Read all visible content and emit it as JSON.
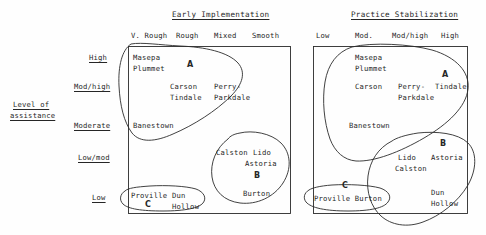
{
  "axis": {
    "y_label_line1": "Level of",
    "y_label_line2": "assistance",
    "row_labels": [
      "High",
      "Mod/high",
      "Moderate",
      "Low/mod",
      "Low"
    ]
  },
  "panels": [
    {
      "title": "Early Implementation",
      "columns": [
        "V. Rough",
        "Rough",
        "Mixed",
        "Smooth"
      ],
      "clusters": [
        {
          "letter": "A",
          "members": [
            "Masepa",
            "Plummet",
            "Carson",
            "Perry-",
            "Tindale",
            "Parkdale",
            "Banestown"
          ]
        },
        {
          "letter": "B",
          "members": [
            "Calston",
            "Lido",
            "Astoria",
            "Burton"
          ]
        },
        {
          "letter": "C",
          "members": [
            "Proville",
            "Dun",
            "Hollow"
          ]
        }
      ],
      "labels": {
        "masepa": "Masepa",
        "plummet": "Plummet",
        "a_letter": "A",
        "carson": "Carson",
        "perry": "Perry-",
        "tindale": "Tindale",
        "parkdale": "Parkdale",
        "banestown": "Banestown",
        "calston": "Calston",
        "lido": "Lido",
        "astoria": "Astoria",
        "b_letter": "B",
        "burton": "Burton",
        "proville": "Proville",
        "dun": "Dun",
        "hollow": "Hollow",
        "c_letter": "C"
      }
    },
    {
      "title": "Practice Stabilization",
      "columns": [
        "Low",
        "Mod.",
        "Mod/high",
        "High"
      ],
      "clusters": [
        {
          "letter": "A",
          "members": [
            "Masepa",
            "Plummet",
            "Carson",
            "Perry-",
            "Tindale",
            "Parkdale",
            "Banestown"
          ]
        },
        {
          "letter": "B",
          "members": [
            "Lido",
            "Astoria",
            "Calston",
            "Dun",
            "Hollow"
          ]
        },
        {
          "letter": "C",
          "members": [
            "Proville",
            "Burton"
          ]
        }
      ],
      "labels": {
        "masepa": "Masepa",
        "plummet": "Plummet",
        "a_letter": "A",
        "carson": "Carson",
        "perry": "Perry-",
        "tindale": "Tindale",
        "parkdale": "Parkdale",
        "banestown": "Banestown",
        "b_letter": "B",
        "lido": "Lido",
        "astoria": "Astoria",
        "calston": "Calston",
        "dun": "Dun",
        "hollow": "Hollow",
        "c_letter": "C",
        "proville_burton": "Proville Burton"
      }
    }
  ],
  "colors": {
    "ink": "#262626",
    "background": "#fefefe"
  }
}
